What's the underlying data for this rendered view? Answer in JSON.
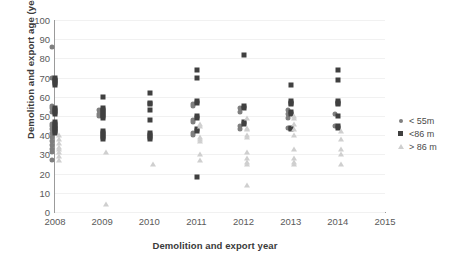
{
  "chart_data": {
    "type": "scatter",
    "title": "",
    "xlabel": "Demolition and export year",
    "ylabel": "Demolition and export  age (year)",
    "xlim": [
      2008,
      2015
    ],
    "ylim": [
      0,
      100
    ],
    "x_ticks": [
      "2008",
      "2009",
      "2010",
      "2011",
      "2012",
      "2013",
      "2014",
      "2015"
    ],
    "y_ticks": [
      "0",
      "10",
      "20",
      "30",
      "40",
      "50",
      "60",
      "70",
      "80",
      "90",
      "100"
    ],
    "grid": true,
    "legend_position": "right",
    "series": [
      {
        "name": "< 55m",
        "marker": "circle",
        "color": "#7f7f7f",
        "points": [
          {
            "x": 2008,
            "y": 86
          },
          {
            "x": 2008,
            "y": 70
          },
          {
            "x": 2008,
            "y": 55
          },
          {
            "x": 2008,
            "y": 54
          },
          {
            "x": 2008,
            "y": 52
          },
          {
            "x": 2008,
            "y": 46
          },
          {
            "x": 2008,
            "y": 45
          },
          {
            "x": 2008,
            "y": 43
          },
          {
            "x": 2008,
            "y": 41
          },
          {
            "x": 2008,
            "y": 39
          },
          {
            "x": 2008,
            "y": 37
          },
          {
            "x": 2008,
            "y": 35
          },
          {
            "x": 2008,
            "y": 33
          },
          {
            "x": 2008,
            "y": 31
          },
          {
            "x": 2008,
            "y": 27
          },
          {
            "x": 2009,
            "y": 53
          },
          {
            "x": 2009,
            "y": 51
          },
          {
            "x": 2009,
            "y": 50
          },
          {
            "x": 2011,
            "y": 56
          },
          {
            "x": 2011,
            "y": 55
          },
          {
            "x": 2011,
            "y": 48
          },
          {
            "x": 2011,
            "y": 47
          },
          {
            "x": 2011,
            "y": 41
          },
          {
            "x": 2011,
            "y": 40
          },
          {
            "x": 2012,
            "y": 54
          },
          {
            "x": 2012,
            "y": 52
          },
          {
            "x": 2012,
            "y": 45
          },
          {
            "x": 2012,
            "y": 43
          },
          {
            "x": 2013,
            "y": 53
          },
          {
            "x": 2013,
            "y": 51
          },
          {
            "x": 2013,
            "y": 49
          },
          {
            "x": 2013,
            "y": 44
          },
          {
            "x": 2014,
            "y": 51
          },
          {
            "x": 2014,
            "y": 45
          }
        ]
      },
      {
        "name": "<86 m",
        "marker": "square",
        "color": "#404040",
        "points": [
          {
            "x": 2008,
            "y": 70
          },
          {
            "x": 2008,
            "y": 69
          },
          {
            "x": 2008,
            "y": 68
          },
          {
            "x": 2008,
            "y": 67
          },
          {
            "x": 2008,
            "y": 66
          },
          {
            "x": 2008,
            "y": 54
          },
          {
            "x": 2008,
            "y": 53
          },
          {
            "x": 2008,
            "y": 52
          },
          {
            "x": 2008,
            "y": 51
          },
          {
            "x": 2008,
            "y": 47
          },
          {
            "x": 2008,
            "y": 46
          },
          {
            "x": 2008,
            "y": 45
          },
          {
            "x": 2008,
            "y": 44
          },
          {
            "x": 2008,
            "y": 43
          },
          {
            "x": 2008,
            "y": 42
          },
          {
            "x": 2008,
            "y": 41
          },
          {
            "x": 2009,
            "y": 60
          },
          {
            "x": 2009,
            "y": 54
          },
          {
            "x": 2009,
            "y": 53
          },
          {
            "x": 2009,
            "y": 52
          },
          {
            "x": 2009,
            "y": 51
          },
          {
            "x": 2009,
            "y": 50
          },
          {
            "x": 2009,
            "y": 49
          },
          {
            "x": 2009,
            "y": 42
          },
          {
            "x": 2009,
            "y": 41
          },
          {
            "x": 2009,
            "y": 40
          },
          {
            "x": 2009,
            "y": 39
          },
          {
            "x": 2009,
            "y": 38
          },
          {
            "x": 2010,
            "y": 62
          },
          {
            "x": 2010,
            "y": 57
          },
          {
            "x": 2010,
            "y": 56
          },
          {
            "x": 2010,
            "y": 53
          },
          {
            "x": 2010,
            "y": 48
          },
          {
            "x": 2010,
            "y": 41
          },
          {
            "x": 2010,
            "y": 40
          },
          {
            "x": 2010,
            "y": 39
          },
          {
            "x": 2010,
            "y": 38
          },
          {
            "x": 2011,
            "y": 74
          },
          {
            "x": 2011,
            "y": 70
          },
          {
            "x": 2011,
            "y": 58
          },
          {
            "x": 2011,
            "y": 57
          },
          {
            "x": 2011,
            "y": 50
          },
          {
            "x": 2011,
            "y": 49
          },
          {
            "x": 2011,
            "y": 43
          },
          {
            "x": 2011,
            "y": 42
          },
          {
            "x": 2011,
            "y": 18
          },
          {
            "x": 2012,
            "y": 82
          },
          {
            "x": 2012,
            "y": 55
          },
          {
            "x": 2012,
            "y": 54
          },
          {
            "x": 2012,
            "y": 47
          },
          {
            "x": 2012,
            "y": 46
          },
          {
            "x": 2013,
            "y": 66
          },
          {
            "x": 2013,
            "y": 58
          },
          {
            "x": 2013,
            "y": 57
          },
          {
            "x": 2013,
            "y": 56
          },
          {
            "x": 2013,
            "y": 52
          },
          {
            "x": 2013,
            "y": 51
          },
          {
            "x": 2013,
            "y": 44
          },
          {
            "x": 2013,
            "y": 43
          },
          {
            "x": 2014,
            "y": 74
          },
          {
            "x": 2014,
            "y": 69
          },
          {
            "x": 2014,
            "y": 58
          },
          {
            "x": 2014,
            "y": 57
          },
          {
            "x": 2014,
            "y": 56
          },
          {
            "x": 2014,
            "y": 50
          },
          {
            "x": 2014,
            "y": 45
          },
          {
            "x": 2014,
            "y": 44
          }
        ]
      },
      {
        "name": "> 86 m",
        "marker": "triangle",
        "color": "#cfcfcf",
        "points": [
          {
            "x": 2008,
            "y": 40
          },
          {
            "x": 2008,
            "y": 38
          },
          {
            "x": 2008,
            "y": 36
          },
          {
            "x": 2008,
            "y": 34
          },
          {
            "x": 2008,
            "y": 33
          },
          {
            "x": 2008,
            "y": 31
          },
          {
            "x": 2008,
            "y": 29
          },
          {
            "x": 2008,
            "y": 27
          },
          {
            "x": 2009,
            "y": 31
          },
          {
            "x": 2009,
            "y": 4
          },
          {
            "x": 2010,
            "y": 25
          },
          {
            "x": 2011,
            "y": 46
          },
          {
            "x": 2011,
            "y": 45
          },
          {
            "x": 2011,
            "y": 39
          },
          {
            "x": 2011,
            "y": 38
          },
          {
            "x": 2011,
            "y": 37
          },
          {
            "x": 2011,
            "y": 30
          },
          {
            "x": 2011,
            "y": 27
          },
          {
            "x": 2012,
            "y": 49
          },
          {
            "x": 2012,
            "y": 44
          },
          {
            "x": 2012,
            "y": 43
          },
          {
            "x": 2012,
            "y": 40
          },
          {
            "x": 2012,
            "y": 39
          },
          {
            "x": 2012,
            "y": 31
          },
          {
            "x": 2012,
            "y": 28
          },
          {
            "x": 2012,
            "y": 26
          },
          {
            "x": 2012,
            "y": 25
          },
          {
            "x": 2012,
            "y": 14
          },
          {
            "x": 2013,
            "y": 50
          },
          {
            "x": 2013,
            "y": 49
          },
          {
            "x": 2013,
            "y": 46
          },
          {
            "x": 2013,
            "y": 43
          },
          {
            "x": 2013,
            "y": 40
          },
          {
            "x": 2013,
            "y": 33
          },
          {
            "x": 2013,
            "y": 28
          },
          {
            "x": 2013,
            "y": 26
          },
          {
            "x": 2013,
            "y": 25
          },
          {
            "x": 2014,
            "y": 42
          },
          {
            "x": 2014,
            "y": 38
          },
          {
            "x": 2014,
            "y": 33
          },
          {
            "x": 2014,
            "y": 30
          },
          {
            "x": 2014,
            "y": 25
          }
        ]
      }
    ]
  },
  "legend": {
    "items": [
      {
        "label": "< 55m"
      },
      {
        "label": "<86 m"
      },
      {
        "label": "> 86 m"
      }
    ]
  }
}
